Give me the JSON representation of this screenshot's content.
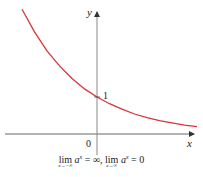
{
  "chart_data": {
    "type": "line",
    "title": "",
    "xlabel": "x",
    "ylabel": "y",
    "series": [
      {
        "name": "y = a^x (0 < a < 1)",
        "color": "#d9343a",
        "x": [
          -3,
          -2.5,
          -2,
          -1.5,
          -1,
          -0.5,
          0,
          0.5,
          1,
          1.5,
          2,
          2.5,
          3,
          3.5,
          4
        ],
        "values": [
          3.37,
          2.76,
          2.25,
          1.84,
          1.5,
          1.22,
          1.0,
          0.82,
          0.67,
          0.54,
          0.44,
          0.36,
          0.3,
          0.24,
          0.2
        ]
      }
    ],
    "tick_labels": {
      "origin": "0",
      "y_intercept": "1"
    },
    "grid": false,
    "legend": "none"
  },
  "labels": {
    "y_axis": "y",
    "x_axis": "x",
    "origin": "0",
    "y_intercept": "1"
  },
  "caption": {
    "lim1_word": "lim",
    "lim1_sub": "x→−∞",
    "lim1_expr_base": "a",
    "lim1_expr_exp": "x",
    "lim1_value": " = ∞, ",
    "lim2_word": "lim",
    "lim2_sub": "x→∞",
    "lim2_expr_base": "a",
    "lim2_expr_exp": "x",
    "lim2_value": " = 0"
  },
  "colors": {
    "curve": "#d9343a",
    "axis": "#555555"
  }
}
